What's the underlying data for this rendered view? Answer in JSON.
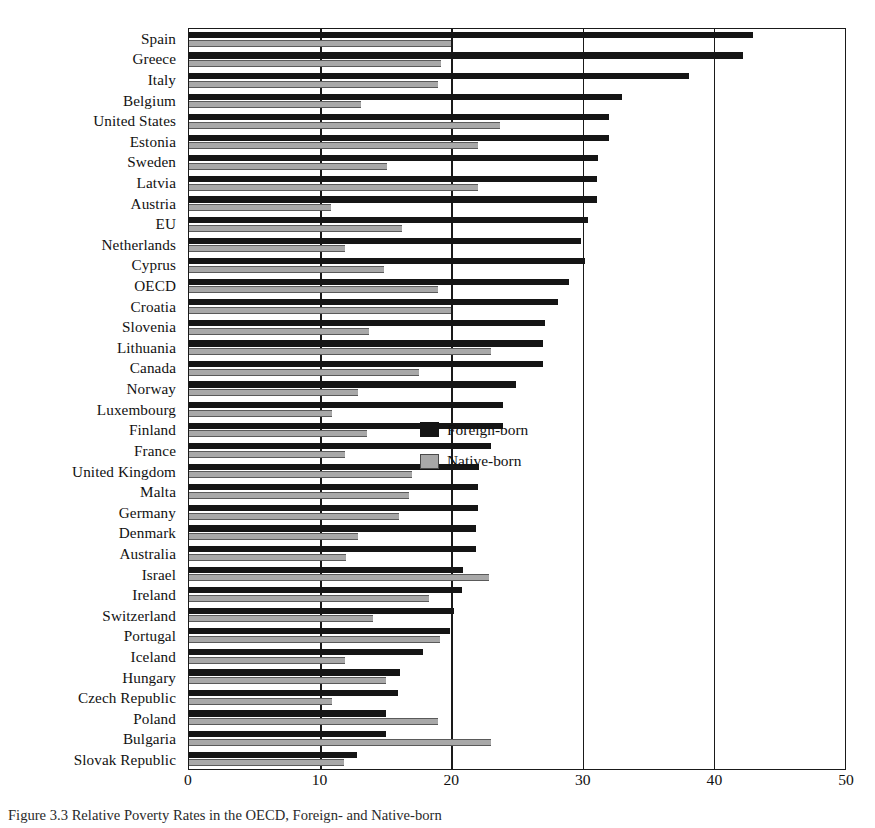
{
  "chart_data": {
    "type": "bar",
    "orientation": "horizontal",
    "title": "",
    "xlabel": "",
    "ylabel": "",
    "xlim": [
      0,
      50
    ],
    "xticks": [
      0,
      10,
      20,
      30,
      40,
      50
    ],
    "grid": true,
    "legend_position": "middle-right",
    "categories": [
      "Spain",
      "Greece",
      "Italy",
      "Belgium",
      "United States",
      "Estonia",
      "Sweden",
      "Latvia",
      "Austria",
      "EU",
      "Netherlands",
      "Cyprus",
      "OECD",
      "Croatia",
      "Slovenia",
      "Lithuania",
      "Canada",
      "Norway",
      "Luxembourg",
      "Finland",
      "France",
      "United Kingdom",
      "Malta",
      "Germany",
      "Denmark",
      "Australia",
      "Israel",
      "Ireland",
      "Switzerland",
      "Portugal",
      "Iceland",
      "Hungary",
      "Czech Republic",
      "Poland",
      "Bulgaria",
      "Slovak Republic"
    ],
    "series": [
      {
        "name": "Foreign-born",
        "color": "#151515",
        "values": [
          43.0,
          42.2,
          38.1,
          33.0,
          32.0,
          32.0,
          31.2,
          31.1,
          31.1,
          30.4,
          29.9,
          30.2,
          29.0,
          28.1,
          27.1,
          27.0,
          27.0,
          24.9,
          23.9,
          23.9,
          23.0,
          22.1,
          22.0,
          22.0,
          21.9,
          21.9,
          20.9,
          20.8,
          20.2,
          19.9,
          17.8,
          16.1,
          15.9,
          15.0,
          15.0,
          12.8
        ]
      },
      {
        "name": "Native-born",
        "color": "#a8a8a8",
        "values": [
          20.0,
          19.2,
          19.0,
          13.1,
          23.7,
          22.0,
          15.1,
          22.0,
          10.8,
          16.2,
          11.9,
          14.9,
          19.0,
          20.0,
          13.7,
          23.0,
          17.5,
          12.9,
          10.9,
          13.6,
          11.9,
          17.0,
          16.8,
          16.0,
          12.9,
          12.0,
          22.9,
          18.3,
          14.0,
          19.1,
          11.9,
          15.0,
          10.9,
          19.0,
          23.0,
          11.8
        ]
      }
    ]
  },
  "legend": {
    "items": [
      {
        "label": "Foreign-born",
        "swatch": "dark-swatch"
      },
      {
        "label": "Native-born",
        "swatch": "gray-swatch"
      }
    ]
  },
  "axis": {
    "x_tick_labels": [
      "0",
      "10",
      "20",
      "30",
      "40",
      "50"
    ]
  },
  "caption": {
    "text": "Figure 3.3  Relative Poverty Rates in the OECD, Foreign- and Native-born"
  }
}
